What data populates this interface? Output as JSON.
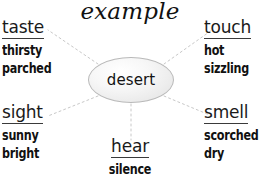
{
  "title": "example",
  "center": {
    "label": "desert",
    "shape": "ellipse"
  },
  "senses": [
    {
      "id": "taste",
      "title": "taste",
      "words": [
        "thirsty",
        "parched"
      ]
    },
    {
      "id": "touch",
      "title": "touch",
      "words": [
        "hot",
        "sizzling"
      ]
    },
    {
      "id": "sight",
      "title": "sight",
      "words": [
        "sunny",
        "bright"
      ]
    },
    {
      "id": "smell",
      "title": "smell",
      "words": [
        "scorched",
        "dry"
      ]
    },
    {
      "id": "hear",
      "title": "hear",
      "words": [
        "silence"
      ]
    }
  ],
  "colors": {
    "text": "#111111",
    "underline": "#3a3a3a",
    "connector": "#c8c8c8",
    "node_border": "#b9b9b9",
    "background": "#ffffff"
  }
}
